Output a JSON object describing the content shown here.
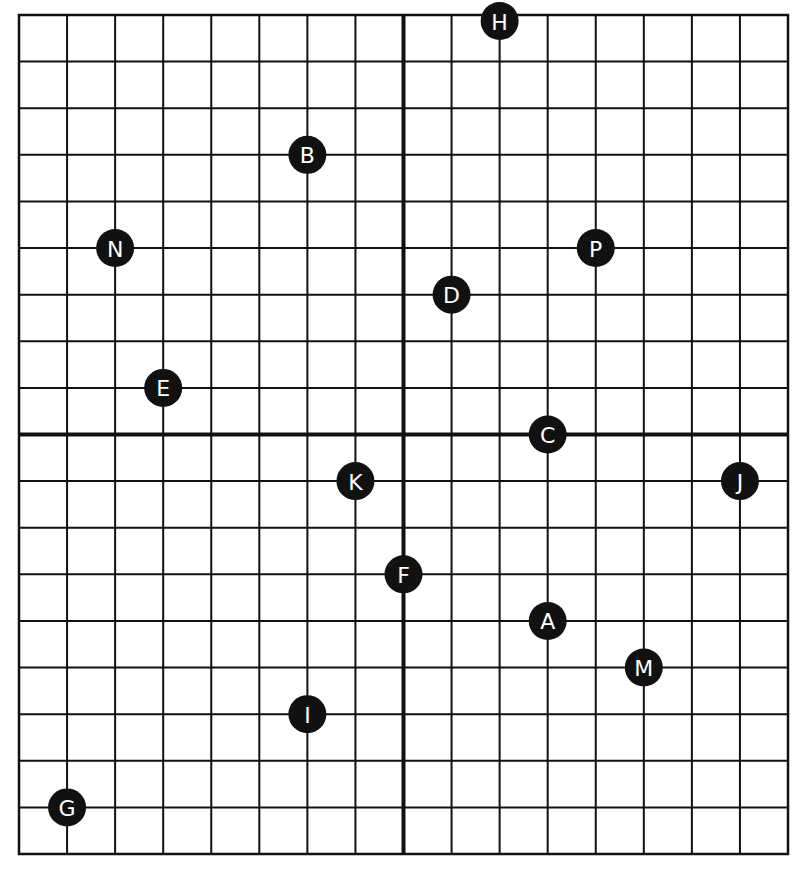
{
  "diagram": {
    "type": "coordinate-grid",
    "x_range": [
      -8,
      8
    ],
    "y_range": [
      -9,
      9
    ],
    "grid_step": 1,
    "axes_visible": true,
    "tick_labels_visible": false,
    "colors": {
      "grid": "#111111",
      "axis": "#111111",
      "point_fill": "#111111",
      "label": "#ffffff",
      "background": "#ffffff"
    }
  },
  "points": [
    {
      "label": "A",
      "x": 3,
      "y": -4
    },
    {
      "label": "B",
      "x": -2,
      "y": 6
    },
    {
      "label": "C",
      "x": 3,
      "y": 0
    },
    {
      "label": "D",
      "x": 1,
      "y": 3
    },
    {
      "label": "E",
      "x": -5,
      "y": 1
    },
    {
      "label": "F",
      "x": 0,
      "y": -3
    },
    {
      "label": "G",
      "x": -7,
      "y": -8
    },
    {
      "label": "H",
      "x": 2,
      "y": 9
    },
    {
      "label": "I",
      "x": -2,
      "y": -6
    },
    {
      "label": "J",
      "x": 7,
      "y": -1
    },
    {
      "label": "K",
      "x": -1,
      "y": -1
    },
    {
      "label": "M",
      "x": 5,
      "y": -5
    },
    {
      "label": "N",
      "x": -6,
      "y": 4
    },
    {
      "label": "P",
      "x": 4,
      "y": 4
    }
  ]
}
